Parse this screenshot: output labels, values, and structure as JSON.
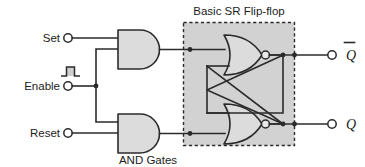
{
  "diagram": {
    "title": "Basic SR Flip-flop",
    "subtitle": "AND Gates",
    "inputs": [
      {
        "label": "Set",
        "icon": "terminal-circle-icon"
      },
      {
        "label": "Enable",
        "icon": "pulse-waveform-icon"
      },
      {
        "label": "Reset",
        "icon": "terminal-circle-icon"
      }
    ],
    "outputs": [
      {
        "label": "Q",
        "overline": true,
        "icon": "terminal-circle-icon"
      },
      {
        "label": "Q",
        "overline": false,
        "icon": "terminal-circle-icon"
      }
    ],
    "gates": [
      {
        "kind": "AND",
        "name": "and-gate-set"
      },
      {
        "kind": "AND",
        "name": "and-gate-reset"
      },
      {
        "kind": "NOR",
        "name": "nor-gate-top"
      },
      {
        "kind": "NOR",
        "name": "nor-gate-bottom"
      }
    ],
    "colors": {
      "gate_fill": "#dcdcdc",
      "box_fill": "#d2d2d2",
      "line": "#2b2b2b",
      "background": "#ffffff"
    }
  }
}
